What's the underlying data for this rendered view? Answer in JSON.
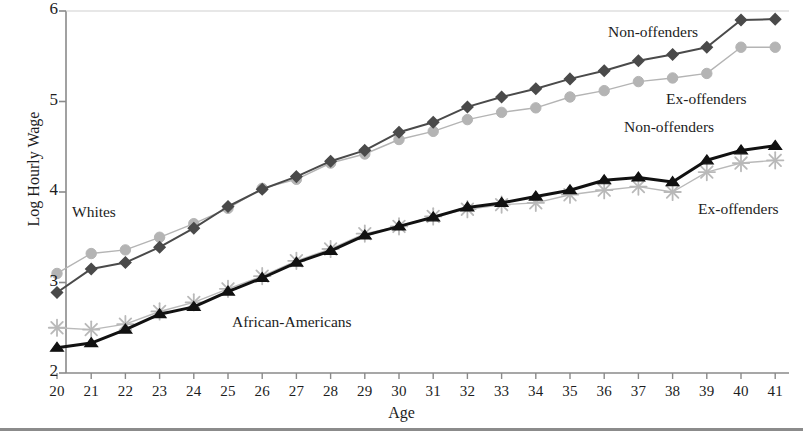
{
  "chart_data": {
    "type": "line",
    "title": "",
    "xlabel": "Age",
    "ylabel": "Log Hourly Wage",
    "xlim": [
      19.5,
      41.5
    ],
    "ylim": [
      2,
      6
    ],
    "yticks": [
      2,
      3,
      4,
      5,
      6
    ],
    "grid": false,
    "legend_position": "inline-annotations",
    "x": [
      20,
      21,
      22,
      23,
      24,
      25,
      26,
      27,
      28,
      29,
      30,
      31,
      32,
      33,
      34,
      35,
      36,
      37,
      38,
      39,
      40,
      41
    ],
    "categories": [
      "20",
      "21",
      "22",
      "23",
      "24",
      "25",
      "26",
      "27",
      "28",
      "29",
      "30",
      "31",
      "32",
      "33",
      "34",
      "35",
      "36",
      "37",
      "38",
      "39",
      "40",
      "41"
    ],
    "series": [
      {
        "name": "Whites - Non-offenders",
        "group": "Whites",
        "marker": "diamond",
        "color": "#4a4a4a",
        "values": [
          2.89,
          3.15,
          3.22,
          3.39,
          3.6,
          3.84,
          4.03,
          4.17,
          4.34,
          4.46,
          4.66,
          4.77,
          4.94,
          5.05,
          5.14,
          5.25,
          5.34,
          5.45,
          5.52,
          5.6,
          5.9,
          5.91
        ]
      },
      {
        "name": "Whites - Ex-offenders",
        "group": "Whites",
        "marker": "circle",
        "color": "#b4b4b4",
        "values": [
          3.1,
          3.32,
          3.36,
          3.5,
          3.65,
          3.82,
          4.04,
          4.14,
          4.32,
          4.42,
          4.58,
          4.67,
          4.8,
          4.88,
          4.93,
          5.05,
          5.12,
          5.22,
          5.26,
          5.31,
          5.6,
          5.6
        ]
      },
      {
        "name": "African-Americans - Non-offenders",
        "group": "African-Americans",
        "marker": "triangle",
        "color": "#111111",
        "values": [
          2.28,
          2.33,
          2.48,
          2.65,
          2.73,
          2.9,
          3.05,
          3.22,
          3.35,
          3.52,
          3.62,
          3.72,
          3.83,
          3.88,
          3.95,
          4.02,
          4.13,
          4.16,
          4.11,
          4.35,
          4.46,
          4.51
        ]
      },
      {
        "name": "African-Americans - Ex-offenders",
        "group": "African-Americans",
        "marker": "asterisk",
        "color": "#b9b9b9",
        "values": [
          2.5,
          2.48,
          2.54,
          2.68,
          2.78,
          2.93,
          3.07,
          3.24,
          3.37,
          3.54,
          3.62,
          3.73,
          3.81,
          3.86,
          3.88,
          3.97,
          4.02,
          4.06,
          4.0,
          4.22,
          4.32,
          4.35
        ]
      }
    ],
    "annotations": [
      {
        "id": "whites",
        "text": "Whites",
        "x_px": 72,
        "y_px": 203
      },
      {
        "id": "african_americans",
        "text": "African-Americans",
        "x_px": 232,
        "y_px": 313
      },
      {
        "id": "whites_nonoff",
        "text": "Non-offenders",
        "x_px": 608,
        "y_px": 23
      },
      {
        "id": "whites_exoff",
        "text": "Ex-offenders",
        "x_px": 666,
        "y_px": 90
      },
      {
        "id": "aa_nonoff",
        "text": "Non-offenders",
        "x_px": 624,
        "y_px": 118
      },
      {
        "id": "aa_exoff",
        "text": "Ex-offenders",
        "x_px": 698,
        "y_px": 200
      }
    ]
  },
  "colors": {
    "axis": "#8a8a8a",
    "whites_non_offenders": "#4a4a4a",
    "whites_ex_offenders": "#b4b4b4",
    "aa_non_offenders": "#111111",
    "aa_ex_offenders": "#b9b9b9",
    "text": "#1d1d1d",
    "background": "#ffffff"
  }
}
